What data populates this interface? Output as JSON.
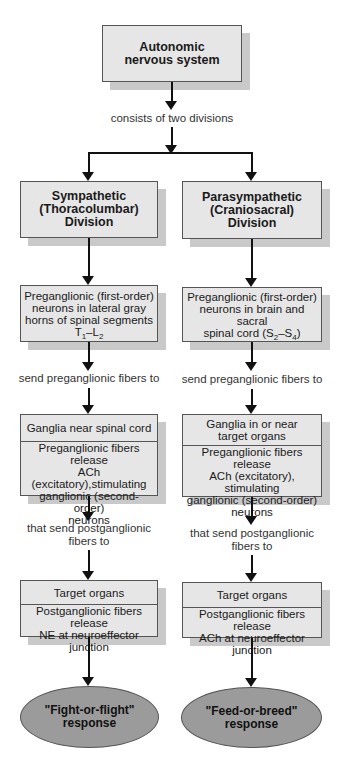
{
  "root": {
    "title_line1": "Autonomic",
    "title_line2": "nervous system"
  },
  "root_connector_label": "consists of two divisions",
  "columns": [
    {
      "division": {
        "line1": "Sympathetic",
        "line2": "(Thoracolumbar)",
        "line3": "Division"
      },
      "preganglionic": {
        "line1": "Preganglionic (first-order)",
        "line2": "neurons in lateral gray",
        "line3": "horns of spinal segments",
        "seg_a": "T",
        "seg_a_sub": "1",
        "dash": "–",
        "seg_b": "L",
        "seg_b_sub": "2"
      },
      "label_preganglionic": "send preganglionic fibers to",
      "ganglia": {
        "header": "Ganglia near spinal cord",
        "line1": "Preganglionic fibers release",
        "line2": "ACh (excitatory),stimulating",
        "line3": "ganglionic (second-order)",
        "line4": "neurons"
      },
      "label_postganglionic_line1": "that send postganglionic",
      "label_postganglionic_line2": "fibers to",
      "target": {
        "header": "Target organs",
        "line1": "Postganglionic fibers release",
        "line2": "NE at neuroeffector junction"
      },
      "response": {
        "line1": "\"Fight-or-flight\"",
        "line2": "response"
      }
    },
    {
      "division": {
        "line1": "Parasympathetic",
        "line2": "(Craniosacral)",
        "line3": "Division"
      },
      "preganglionic": {
        "line1": "Preganglionic (first-order)",
        "line2": "neurons in brain and sacral",
        "line3_prefix": "spinal cord (",
        "seg_a": "S",
        "seg_a_sub": "2",
        "dash": "–",
        "seg_b": "S",
        "seg_b_sub": "4",
        "line3_suffix": ")"
      },
      "label_preganglionic": "send preganglionic fibers to",
      "ganglia": {
        "header_line1": "Ganglia in or near",
        "header_line2": "target organs",
        "line1": "Preganglionic fibers release",
        "line2": "ACh (excitatory), stimulating",
        "line3": "ganglionic (second-order)",
        "line4": "neurons"
      },
      "label_postganglionic_line1": "that send postganglionic",
      "label_postganglionic_line2": "fibers to",
      "target": {
        "header": "Target organs",
        "line1": "Postganglionic fibers release",
        "line2": "ACh at neuroeffector junction"
      },
      "response": {
        "line1": "\"Feed-or-breed\"",
        "line2": "response"
      }
    }
  ],
  "colors": {
    "box_fill": "#e6e6e6",
    "box_border": "#555555",
    "box_shadow": "#c9c9c9",
    "ellipse_fill": "#9b9b9b",
    "arrow": "#111111"
  }
}
